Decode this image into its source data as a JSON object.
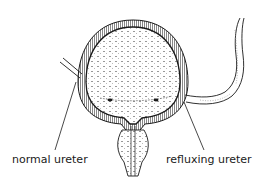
{
  "diagram": {
    "labels": {
      "normal_ureter": "normal ureter",
      "refluxing_ureter": "refluxing ureter"
    },
    "colors": {
      "ink": "#1a1a1a",
      "background": "#ffffff"
    }
  }
}
